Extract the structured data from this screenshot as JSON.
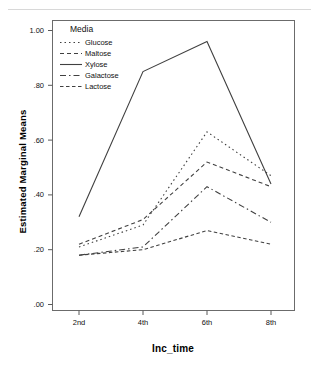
{
  "chart_data": {
    "type": "line",
    "title": "",
    "xlabel": "Inc_time",
    "ylabel": "Estimated Marginal Means",
    "categories": [
      "2nd",
      "4th",
      "6th",
      "8th"
    ],
    "ylim": [
      0.0,
      1.05
    ],
    "yticks": [
      0.0,
      0.2,
      0.4,
      0.6,
      0.8,
      1.0
    ],
    "ytick_labels": [
      ".00",
      ".20",
      ".40",
      ".60",
      ".80",
      "1.00"
    ],
    "grid": false,
    "legend": {
      "title": "Media",
      "position": "inside-top-left",
      "entries": [
        {
          "name": "Glucose",
          "style": "dotted"
        },
        {
          "name": "Maltose",
          "style": "dashed"
        },
        {
          "name": "Xylose",
          "style": "solid"
        },
        {
          "name": "Galactose",
          "style": "dash-dot"
        },
        {
          "name": "Lactose",
          "style": "dashed-short"
        }
      ]
    },
    "series": [
      {
        "name": "Glucose",
        "style": "dotted",
        "values": [
          0.21,
          0.29,
          0.63,
          0.47
        ]
      },
      {
        "name": "Maltose",
        "style": "dashed",
        "values": [
          0.22,
          0.31,
          0.52,
          0.43
        ]
      },
      {
        "name": "Xylose",
        "style": "solid",
        "values": [
          0.32,
          0.85,
          0.96,
          0.44
        ]
      },
      {
        "name": "Galactose",
        "style": "dash-dot",
        "values": [
          0.18,
          0.21,
          0.43,
          0.3
        ]
      },
      {
        "name": "Lactose",
        "style": "dashed-short",
        "values": [
          0.18,
          0.2,
          0.27,
          0.22
        ]
      }
    ],
    "colors": {
      "line": "#404040",
      "axis": "#595959",
      "background": "#ffffff"
    }
  }
}
